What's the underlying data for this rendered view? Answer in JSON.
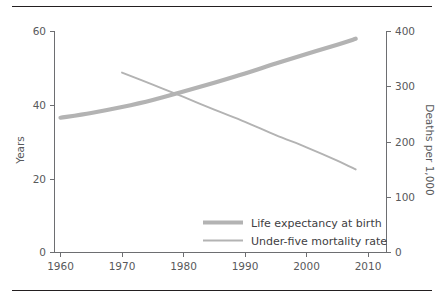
{
  "figure": {
    "rule_top": "horizontal-rule",
    "rule_bottom": "horizontal-rule"
  },
  "chart_data": {
    "type": "line",
    "title": "",
    "xlabel": "",
    "ylabel": "Years",
    "y2label": "Deaths per 1,000",
    "grid": false,
    "legend_position": "inside-bottom-right",
    "xlim": [
      1960,
      2010
    ],
    "ylim": [
      0,
      60
    ],
    "y2lim": [
      0,
      400
    ],
    "x_ticks": [
      1960,
      1970,
      1980,
      1990,
      2000,
      2010
    ],
    "x_tick_labels": [
      "1960",
      "1970",
      "1980",
      "1990",
      "2000",
      "2010"
    ],
    "y_ticks": [
      0,
      20,
      40,
      60
    ],
    "y_tick_labels": [
      "0",
      "20",
      "40",
      "60"
    ],
    "y2_ticks": [
      0,
      100,
      200,
      300,
      400
    ],
    "y2_tick_labels": [
      "0",
      "100",
      "200",
      "300",
      "400"
    ],
    "series": [
      {
        "name": "Life expectancy at birth",
        "axis": "left",
        "units": "Years",
        "x": [
          1960,
          1965,
          1970,
          1975,
          1980,
          1985,
          1990,
          1995,
          2000,
          2005,
          2008
        ],
        "values": [
          36.5,
          37.8,
          39.4,
          41.3,
          43.6,
          46.0,
          48.5,
          51.2,
          53.8,
          56.3,
          57.9
        ]
      },
      {
        "name": "Under-five mortality rate",
        "axis": "right",
        "units": "Deaths per 1,000",
        "x": [
          1970,
          1975,
          1980,
          1985,
          1990,
          1995,
          2000,
          2005,
          2008
        ],
        "values": [
          325,
          303,
          281,
          258,
          236,
          212,
          190,
          166,
          150
        ]
      }
    ],
    "colors": {
      "series_line": "#b3b3b3",
      "axis": "#6d6e71",
      "text": "#58595b",
      "rule": "#231f20"
    }
  },
  "legend": {
    "entries": [
      {
        "label": "Life expectancy at birth",
        "style": "thick"
      },
      {
        "label": "Under-five mortality rate",
        "style": "thin"
      }
    ]
  }
}
